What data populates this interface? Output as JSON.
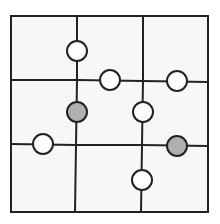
{
  "puzzle": {
    "type": "3x3 grid with circle markers on edges",
    "frame": {
      "x1": 11,
      "y1": 16,
      "x2": 208,
      "y2": 212
    },
    "colors": {
      "background": "#f7f7f7",
      "line": "#222222",
      "white_circle": "#ffffff",
      "gray_circle": "#b0b0b0"
    },
    "lines": [
      {
        "x1": 77,
        "y1": 16,
        "x2": 77,
        "y2": 80
      },
      {
        "x1": 77,
        "y1": 80,
        "x2": 76,
        "y2": 145
      },
      {
        "x1": 76,
        "y1": 145,
        "x2": 75,
        "y2": 212
      },
      {
        "x1": 143,
        "y1": 16,
        "x2": 143,
        "y2": 81
      },
      {
        "x1": 143,
        "y1": 81,
        "x2": 142,
        "y2": 145
      },
      {
        "x1": 142,
        "y1": 145,
        "x2": 141,
        "y2": 212
      },
      {
        "x1": 11,
        "y1": 80,
        "x2": 77,
        "y2": 80
      },
      {
        "x1": 77,
        "y1": 80,
        "x2": 143,
        "y2": 81
      },
      {
        "x1": 143,
        "y1": 81,
        "x2": 208,
        "y2": 82
      },
      {
        "x1": 11,
        "y1": 144,
        "x2": 76,
        "y2": 145
      },
      {
        "x1": 76,
        "y1": 145,
        "x2": 142,
        "y2": 145
      },
      {
        "x1": 142,
        "y1": 145,
        "x2": 208,
        "y2": 146
      }
    ],
    "circles": [
      {
        "cx": 77,
        "cy": 51,
        "fill": "white"
      },
      {
        "cx": 110,
        "cy": 80,
        "fill": "white"
      },
      {
        "cx": 177,
        "cy": 81,
        "fill": "white"
      },
      {
        "cx": 77,
        "cy": 112,
        "fill": "gray"
      },
      {
        "cx": 143,
        "cy": 112,
        "fill": "white"
      },
      {
        "cx": 43,
        "cy": 144,
        "fill": "white"
      },
      {
        "cx": 177,
        "cy": 146,
        "fill": "gray"
      },
      {
        "cx": 142,
        "cy": 180,
        "fill": "white"
      }
    ],
    "circle_radius": 10
  }
}
